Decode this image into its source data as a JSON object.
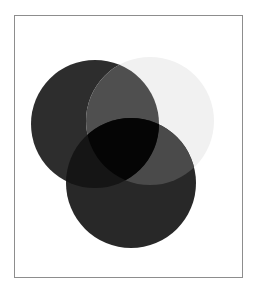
{
  "figure": {
    "type": "venn-diagram",
    "background_color": "#ffffff",
    "frame": {
      "border_color": "#8d8d8d",
      "border_width_px": 1,
      "x": 14,
      "y": 15,
      "width": 229,
      "height": 263
    },
    "blend_mode": "multiply",
    "set_count": 3
  },
  "chart_data": {
    "type": "venn",
    "title": "",
    "subtitle": "",
    "xlabel": "",
    "ylabel": "",
    "grid": false,
    "legend": "none",
    "blend_mode": "multiply",
    "sets": [
      {
        "id": "set-a",
        "label": "",
        "position": "upper-left",
        "color": "#2d2d2d",
        "opacity": 1,
        "center_x": 95,
        "center_y": 124,
        "radius": 64
      },
      {
        "id": "set-b",
        "label": "",
        "position": "upper-right",
        "color": "#f1f1f1",
        "opacity": 1,
        "center_x": 150,
        "center_y": 121,
        "radius": 64
      },
      {
        "id": "set-c",
        "label": "",
        "position": "lower-center",
        "color": "#282828",
        "opacity": 1,
        "center_x": 131,
        "center_y": 183,
        "radius": 65
      }
    ],
    "region_colors": {
      "a_only": "#2d2d2d",
      "b_only": "#f1f1f1",
      "c_only": "#282828",
      "a_and_b": "#4f4f4f",
      "b_and_c": "#4a4a4a",
      "a_and_c": "#151515",
      "a_and_b_and_c": "#050505"
    }
  }
}
